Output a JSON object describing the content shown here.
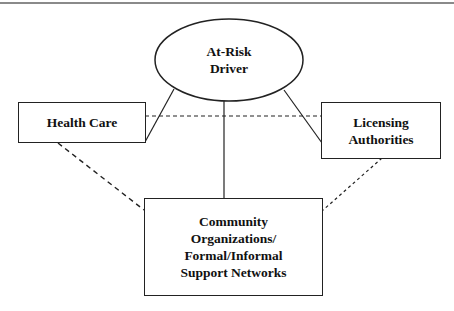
{
  "diagram": {
    "center": {
      "label_lines": [
        "At-Risk",
        "Driver"
      ]
    },
    "left": {
      "label_lines": [
        "Health Care"
      ]
    },
    "right": {
      "label_lines": [
        "Licensing",
        "Authorities"
      ]
    },
    "bottom": {
      "label_lines": [
        "Community",
        "Organizations/",
        "Formal/Informal",
        "Support Networks"
      ]
    },
    "edges": [
      {
        "from": "center",
        "to": "left",
        "style": "solid"
      },
      {
        "from": "center",
        "to": "right",
        "style": "solid"
      },
      {
        "from": "center",
        "to": "bottom",
        "style": "solid"
      },
      {
        "from": "left",
        "to": "right",
        "style": "dashed"
      },
      {
        "from": "left",
        "to": "bottom",
        "style": "dashed"
      },
      {
        "from": "right",
        "to": "bottom",
        "style": "dashed"
      }
    ],
    "colors": {
      "stroke": "#222222",
      "rule": "#8a8a8a"
    }
  }
}
